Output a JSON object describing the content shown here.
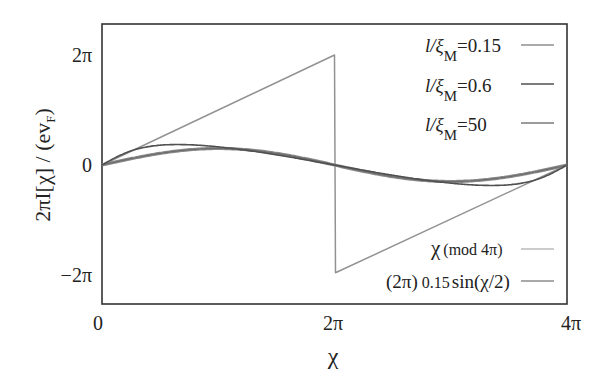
{
  "chart_data": {
    "type": "line",
    "title": "",
    "xlabel": "χ",
    "ylabel": "2πI[χ] / (ev_F)",
    "xlim": [
      0,
      "4π"
    ],
    "ylim": [
      "-2.5π",
      "2.5π"
    ],
    "x_ticks": [
      "0",
      "2π",
      "4π"
    ],
    "y_ticks": [
      "2π",
      "0",
      "−2π"
    ],
    "grid": false,
    "legend_position": "inside-right",
    "series": [
      {
        "name": "l/ξ_M=0.15",
        "color": "#8a8a8a",
        "description": "sawtooth, nearly χ (mod 4π)",
        "points_units_pi": [
          [
            0,
            0
          ],
          [
            2,
            2
          ],
          [
            2.0,
            -1.96
          ],
          [
            4,
            0
          ]
        ]
      },
      {
        "name": "l/ξ_M=0.6",
        "color": "#555555",
        "points_units_pi": [
          [
            0,
            0
          ],
          [
            0.5,
            0.36
          ],
          [
            1.0,
            0.58
          ],
          [
            1.4,
            0.65
          ],
          [
            1.7,
            0.5
          ],
          [
            2,
            0
          ],
          [
            2.3,
            -0.5
          ],
          [
            2.6,
            -0.65
          ],
          [
            3.0,
            -0.58
          ],
          [
            3.5,
            -0.36
          ],
          [
            4,
            0
          ]
        ]
      },
      {
        "name": "l/ξ_M=50",
        "color": "#777777",
        "points_units_pi": [
          [
            0,
            0
          ],
          [
            1,
            0.21
          ],
          [
            2,
            0
          ],
          [
            3,
            -0.21
          ],
          [
            4,
            0
          ]
        ]
      },
      {
        "name": "χ (mod 4π)",
        "color": "#999999",
        "points_units_pi": [
          [
            0,
            0
          ],
          [
            2,
            2
          ],
          [
            2,
            -2
          ],
          [
            4,
            0
          ]
        ]
      },
      {
        "name": "(2π) 0.15 sin(χ/2)",
        "color": "#8c8c8c",
        "points_units_pi": [
          [
            0,
            0
          ],
          [
            1,
            0.3
          ],
          [
            2,
            0
          ],
          [
            3,
            -0.3
          ],
          [
            4,
            0
          ]
        ]
      }
    ]
  },
  "labels": {
    "ylabel_main": "2πI[χ] / (ev",
    "ylabel_sub": "F",
    "ylabel_close": ")",
    "xlabel": "χ",
    "xticks": [
      "0",
      "2π",
      "4π"
    ],
    "yticks": [
      "2π",
      "0",
      "−2π"
    ]
  },
  "legend": [
    {
      "prefix": "l/ξ",
      "sub": "M",
      "suffix": "=0.15"
    },
    {
      "prefix": "l/ξ",
      "sub": "M",
      "suffix": "=0.6"
    },
    {
      "prefix": "l/ξ",
      "sub": "M",
      "suffix": "=50"
    },
    {
      "text_a": "χ",
      "text_b": "(mod 4π)"
    },
    {
      "text_a": "(2π)",
      "text_b": "0.15",
      "text_c": "sin(",
      "text_d": "χ/2)"
    }
  ],
  "colors": {
    "axis": "#333333",
    "saw": "#8f8f8f",
    "mid": "#505050",
    "sine": "#7a7a7a"
  }
}
